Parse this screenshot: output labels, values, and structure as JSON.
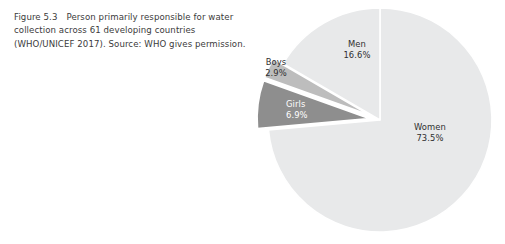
{
  "figure": {
    "number": "Figure 5.3",
    "caption": "Person primarily responsible for water collection across 61 developing countries (WHO/UNICEF 2017). Source: WHO gives permission."
  },
  "chart_data": {
    "type": "pie",
    "title": "",
    "subtitle": "",
    "xlabel": "",
    "ylabel": "",
    "legend": "none",
    "grid": false,
    "start_angle_deg": 0,
    "direction": "clockwise",
    "categories": [
      "Women",
      "Girls",
      "Boys",
      "Men"
    ],
    "values": [
      73.5,
      6.9,
      2.9,
      16.6
    ],
    "value_suffix": "%",
    "slices": [
      {
        "label": "Women",
        "value": 73.5,
        "value_text": "73.5%",
        "color": "#e8e9ea",
        "exploded": false,
        "label_color": "#2f2f2f",
        "label_position": "inside"
      },
      {
        "label": "Girls",
        "value": 6.9,
        "value_text": "6.9%",
        "color": "#8e8e8e",
        "exploded": true,
        "label_color": "#ffffff",
        "label_position": "inside"
      },
      {
        "label": "Boys",
        "value": 2.9,
        "value_text": "2.9%",
        "color": "#bdbdbd",
        "exploded": true,
        "label_color": "#2f2f2f",
        "label_position": "outside"
      },
      {
        "label": "Men",
        "value": 16.6,
        "value_text": "16.6%",
        "color": "#e8e9ea",
        "exploded": false,
        "label_color": "#2f2f2f",
        "label_position": "inside"
      }
    ],
    "colors": {
      "women": "#e8e9ea",
      "girls": "#8e8e8e",
      "boys": "#bdbdbd",
      "men": "#e8e9ea",
      "separator": "#ffffff",
      "background": "#ffffff",
      "caption_text": "#3b3b3b"
    }
  }
}
